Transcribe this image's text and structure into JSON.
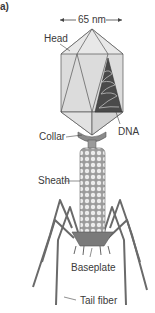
{
  "figure": {
    "panel_label": "a)",
    "dimension_label": "65 nm",
    "labels": {
      "head": "Head",
      "dna": "DNA",
      "collar": "Collar",
      "sheath": "Sheath",
      "baseplate": "Baseplate",
      "tail_fiber": "Tail fiber"
    },
    "colors": {
      "head_fill": "#d9d9d9",
      "head_face_light": "#e6e6e6",
      "outline": "#555555",
      "dna": "#3a3a3a",
      "collar": "#8a8a8a",
      "sheath_bead": "#e8e8e8",
      "fiber": "#6a6a6a"
    }
  }
}
